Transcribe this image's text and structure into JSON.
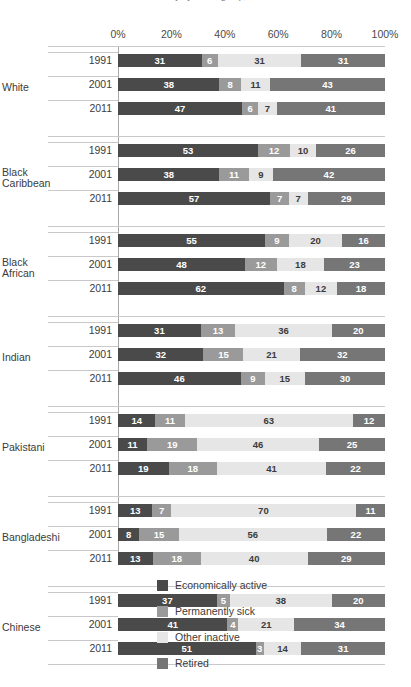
{
  "chart_data": {
    "type": "bar",
    "subtype": "stacked-horizontal-100pct",
    "title": "Economic activity by ethnic group, 1991 to 2011",
    "xlabel": "",
    "ylabel": "",
    "xlim": [
      0,
      100
    ],
    "grid": false,
    "legend_position": "bottom",
    "axis_ticks": [
      "0%",
      "20%",
      "40%",
      "60%",
      "80%",
      "100%"
    ],
    "axis_tick_values": [
      0,
      20,
      40,
      60,
      80,
      100
    ],
    "series": [
      {
        "name": "Economically active",
        "color": "#4a4a4a"
      },
      {
        "name": "Permanently sick",
        "color": "#9a9a9a"
      },
      {
        "name": "Other inactive",
        "color": "#e6e6e6"
      },
      {
        "name": "Retired",
        "color": "#767676"
      }
    ],
    "groups": [
      {
        "label": "White",
        "label_lines": [
          "White"
        ],
        "rows": [
          {
            "year": "1991",
            "values": [
              31,
              6,
              31,
              31
            ]
          },
          {
            "year": "2001",
            "values": [
              38,
              8,
              11,
              43
            ]
          },
          {
            "year": "2011",
            "values": [
              47,
              6,
              7,
              41
            ]
          }
        ]
      },
      {
        "label": "Black Caribbean",
        "label_lines": [
          "Black",
          "Caribbean"
        ],
        "rows": [
          {
            "year": "1991",
            "values": [
              53,
              12,
              10,
              26
            ]
          },
          {
            "year": "2001",
            "values": [
              38,
              11,
              9,
              42
            ]
          },
          {
            "year": "2011",
            "values": [
              57,
              7,
              7,
              29
            ]
          }
        ]
      },
      {
        "label": "Black African",
        "label_lines": [
          "Black",
          "African"
        ],
        "rows": [
          {
            "year": "1991",
            "values": [
              55,
              9,
              20,
              16
            ]
          },
          {
            "year": "2001",
            "values": [
              48,
              12,
              18,
              23
            ]
          },
          {
            "year": "2011",
            "values": [
              62,
              8,
              12,
              18
            ]
          }
        ]
      },
      {
        "label": "Indian",
        "label_lines": [
          "Indian"
        ],
        "rows": [
          {
            "year": "1991",
            "values": [
              31,
              13,
              36,
              20
            ]
          },
          {
            "year": "2001",
            "values": [
              32,
              15,
              21,
              32
            ]
          },
          {
            "year": "2011",
            "values": [
              46,
              9,
              15,
              30
            ]
          }
        ]
      },
      {
        "label": "Pakistani",
        "label_lines": [
          "Pakistani"
        ],
        "rows": [
          {
            "year": "1991",
            "values": [
              14,
              11,
              63,
              12
            ]
          },
          {
            "year": "2001",
            "values": [
              11,
              19,
              46,
              25
            ]
          },
          {
            "year": "2011",
            "values": [
              19,
              18,
              41,
              22
            ]
          }
        ]
      },
      {
        "label": "Bangladeshi",
        "label_lines": [
          "Bangladeshi"
        ],
        "rows": [
          {
            "year": "1991",
            "values": [
              13,
              7,
              70,
              11
            ]
          },
          {
            "year": "2001",
            "values": [
              8,
              15,
              56,
              22
            ]
          },
          {
            "year": "2011",
            "values": [
              13,
              18,
              40,
              29
            ]
          }
        ]
      },
      {
        "label": "Chinese",
        "label_lines": [
          "Chinese"
        ],
        "rows": [
          {
            "year": "1991",
            "values": [
              37,
              5,
              38,
              20
            ]
          },
          {
            "year": "2001",
            "values": [
              41,
              4,
              21,
              34
            ]
          },
          {
            "year": "2011",
            "values": [
              51,
              3,
              14,
              31
            ]
          }
        ]
      }
    ]
  }
}
